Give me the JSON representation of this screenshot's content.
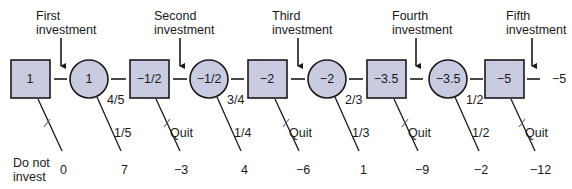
{
  "diagram": {
    "type": "decision-tree",
    "colors": {
      "node_fill": "#c9cbe0",
      "stroke": "#1a1a1a",
      "cut_mark": "#6c7090"
    },
    "investment_labels": [
      {
        "line1": "First",
        "line2": "investment"
      },
      {
        "line1": "Second",
        "line2": "investment"
      },
      {
        "line1": "Third",
        "line2": "investment"
      },
      {
        "line1": "Fourth",
        "line2": "investment"
      },
      {
        "line1": "Fifth",
        "line2": "investment"
      }
    ],
    "decision_nodes": [
      {
        "value": "1"
      },
      {
        "value": "−1/2"
      },
      {
        "value": "−2"
      },
      {
        "value": "−3.5"
      },
      {
        "value": "−5"
      }
    ],
    "chance_nodes": [
      {
        "value": "1",
        "continue_prob": "4/5",
        "stop_prob": "1/5",
        "stop_payoff": "7"
      },
      {
        "value": "−1/2",
        "continue_prob": "3/4",
        "stop_prob": "1/4",
        "stop_payoff": "4"
      },
      {
        "value": "−2",
        "continue_prob": "2/3",
        "stop_prob": "1/3",
        "stop_payoff": "1"
      },
      {
        "value": "−3.5",
        "continue_prob": "1/2",
        "stop_prob": "1/2",
        "stop_payoff": "−2"
      }
    ],
    "decision_branches": [
      {
        "label": "Do not",
        "label2": "invest",
        "payoff": "0"
      },
      {
        "label": "Quit",
        "payoff": "−3"
      },
      {
        "label": "Quit",
        "payoff": "−6"
      },
      {
        "label": "Quit",
        "payoff": "−9"
      },
      {
        "label": "Quit",
        "payoff": "−12"
      }
    ],
    "final_payoff": "−5"
  }
}
